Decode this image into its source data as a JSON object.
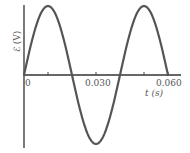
{
  "chart_data": {
    "type": "line",
    "title": "",
    "xlabel": "t (s)",
    "ylabel": "ℰ (V)",
    "x_ticks": [
      0.015,
      0.03,
      0.045,
      0.06
    ],
    "x_tick_labels": [
      "0",
      "0.030",
      "0.060"
    ],
    "xlim": [
      0,
      0.06
    ],
    "grid": false,
    "legend": null,
    "series": [
      {
        "name": "emf",
        "description": "sinusoid, period 0.040 s, starts at 0 rising",
        "period_s": 0.04,
        "x": [
          0,
          0.01,
          0.02,
          0.03,
          0.04,
          0.05,
          0.06
        ],
        "values": [
          0,
          1,
          0,
          -1,
          0,
          1,
          0
        ]
      }
    ]
  },
  "labels": {
    "origin": "0",
    "tick_030": "0.030",
    "tick_060": "0.060",
    "xaxis": "t (s)",
    "yaxis": "ℰ (V)"
  },
  "colors": {
    "curve": "#555555",
    "axis": "#333333"
  }
}
